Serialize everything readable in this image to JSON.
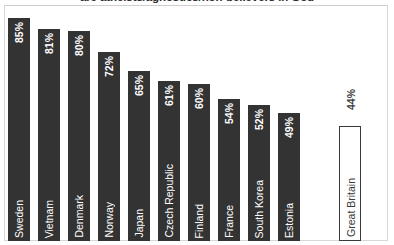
{
  "chart_data": {
    "type": "bar",
    "title": "are atheists/agnostics/non-believers in God",
    "xlabel": "",
    "ylabel": "",
    "ylim": [
      0,
      100
    ],
    "grid": false,
    "legend": "none",
    "categories": [
      "Sweden",
      "Vietnam",
      "Denmark",
      "Norway",
      "Japan",
      "Czech Republic",
      "Finland",
      "France",
      "South Korea",
      "Estonia",
      "Great Britain"
    ],
    "values": [
      85,
      81,
      80,
      72,
      65,
      61,
      60,
      54,
      52,
      49,
      44
    ],
    "value_labels": [
      "85%",
      "81%",
      "80%",
      "72%",
      "65%",
      "61%",
      "60%",
      "54%",
      "52%",
      "49%",
      "44%"
    ],
    "highlight_index": 10,
    "colors": {
      "bar": "#333333",
      "highlight_bar": "#ffffff",
      "highlight_border": "#3a3a3a",
      "bar_label": "#ffffff",
      "highlight_label": "#3a3a3a",
      "frame": "#d8d8d8",
      "background": "#ffffff",
      "title": "#2b2b2b"
    }
  }
}
